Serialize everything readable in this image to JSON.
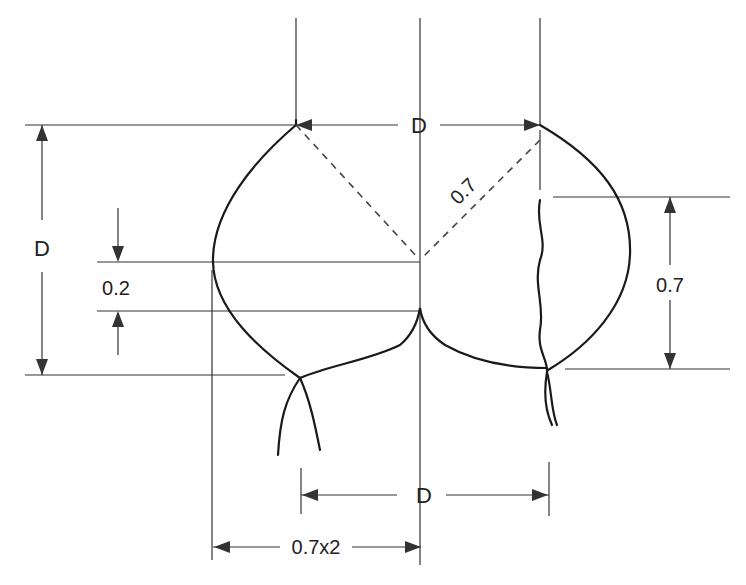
{
  "diagram": {
    "type": "technical-dimension-drawing",
    "colors": {
      "stroke": "#222222",
      "background": "#ffffff"
    },
    "labels": {
      "top_width": "D",
      "left_height": "D",
      "center_gap": "0.2",
      "radius": "0.7",
      "right_height": "0.7",
      "bottom_width": "D",
      "bottom_half_width": "0.7x2"
    }
  }
}
